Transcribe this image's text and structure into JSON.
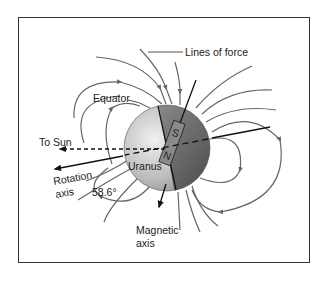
{
  "diagram": {
    "labels": {
      "lines_of_force": "Lines of force",
      "equator": "Equator",
      "to_sun": "To Sun",
      "planet": "Uranus",
      "rotation_axis_line1": "Rotation",
      "rotation_axis_line2": "axis",
      "angle": "58.6°",
      "magnetic_axis_line1": "Magnetic",
      "magnetic_axis_line2": "axis",
      "pole_south": "S",
      "pole_north": "N"
    },
    "angle_between_axes_deg": 58.6,
    "colors": {
      "field_lines": "#666666",
      "axes": "#111111",
      "planet_light": "#d8d8d8",
      "planet_dark": "#5a5a5a",
      "frame": "#333333"
    }
  }
}
